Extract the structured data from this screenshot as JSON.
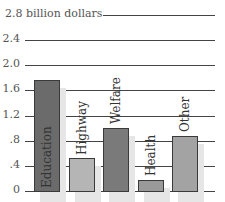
{
  "chart_data": {
    "type": "bar",
    "title": "",
    "ylabel": "billion dollars",
    "xlabel": "",
    "ylim": [
      0,
      2.8
    ],
    "yticks": [
      "0",
      ".4",
      ".8",
      "1.2",
      "1.6",
      "2.0",
      "2.4",
      "2.8"
    ],
    "ytick_values": [
      0,
      0.4,
      0.8,
      1.2,
      1.6,
      2.0,
      2.4,
      2.8
    ],
    "top_tick_label": "2.8 billion dollars",
    "grid": true,
    "legend": "none",
    "categories": [
      "Education",
      "Highway",
      "Welfare",
      "Health",
      "Other"
    ],
    "values": [
      1.76,
      0.53,
      1.0,
      0.18,
      0.88
    ],
    "colors": [
      "#6b6b6b",
      "#b5b5b5",
      "#7a7a7a",
      "#9a9a9a",
      "#a3a3a3"
    ],
    "label_orientation": "vertical, inside/above bars"
  }
}
